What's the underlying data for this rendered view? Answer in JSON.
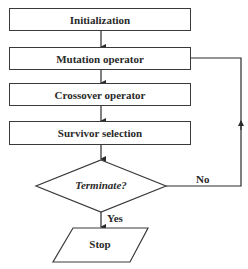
{
  "diagram": {
    "type": "flowchart",
    "nodes": [
      {
        "id": "init",
        "shape": "rectangle",
        "label": "Initialization"
      },
      {
        "id": "mutation",
        "shape": "rectangle",
        "label": "Mutation operator"
      },
      {
        "id": "crossover",
        "shape": "rectangle",
        "label": "Crossover operator"
      },
      {
        "id": "survivor",
        "shape": "rectangle",
        "label": "Survivor selection"
      },
      {
        "id": "terminate",
        "shape": "diamond",
        "label": "Terminate?"
      },
      {
        "id": "stop",
        "shape": "parallelogram",
        "label": "Stop"
      }
    ],
    "edges": [
      {
        "from": "init",
        "to": "mutation",
        "label": ""
      },
      {
        "from": "mutation",
        "to": "crossover",
        "label": ""
      },
      {
        "from": "crossover",
        "to": "survivor",
        "label": ""
      },
      {
        "from": "survivor",
        "to": "terminate",
        "label": ""
      },
      {
        "from": "terminate",
        "to": "stop",
        "label": "Yes"
      },
      {
        "from": "terminate",
        "to": "mutation",
        "label": "No"
      }
    ],
    "edge_labels": {
      "yes": "Yes",
      "no": "No"
    }
  }
}
